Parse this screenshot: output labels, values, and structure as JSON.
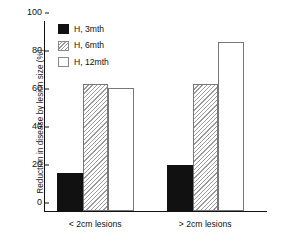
{
  "chart_data": {
    "type": "bar",
    "title": "",
    "subtitle": "",
    "xlabel": "",
    "ylabel": "Reduction in disease by lesion size (%)",
    "categories": [
      "< 2cm lesions",
      "> 2cm lesions"
    ],
    "series": [
      {
        "name": "H, 3mth",
        "fill": "solid",
        "values": [
          20,
          24
        ]
      },
      {
        "name": "H, 6mth",
        "fill": "hatch",
        "values": [
          67,
          67
        ]
      },
      {
        "name": "H, 12mth",
        "fill": "empty",
        "values": [
          65,
          89
        ]
      }
    ],
    "ylim": [
      0,
      100
    ],
    "yticks": [
      0,
      20,
      40,
      60,
      80,
      100
    ],
    "ytick_labels": [
      "0",
      "20",
      "40",
      "60",
      "80",
      "100"
    ],
    "grid": false,
    "legend_position": "upper-left-inside",
    "colors": {
      "solid": "#111111",
      "hatch_line": "#9a9a9a",
      "empty": "#ffffff",
      "axis": "#111111",
      "text": "#111111",
      "background": "#ffffff"
    }
  }
}
